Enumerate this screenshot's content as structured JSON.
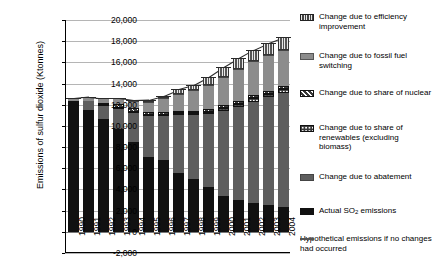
{
  "axes": {
    "ylabel": "Emissions of sulfur dioxide (Ktonnes)",
    "yticks": [
      "20,000",
      "18,000",
      "16,000",
      "14,000",
      "12,000",
      "10,000",
      "8,000",
      "6,000",
      "4,000",
      "2,000",
      "0",
      "-2,000"
    ]
  },
  "legend": {
    "items": [
      {
        "key": "effic",
        "swatch": "vertical-stripe-swatch",
        "label": "Change due to efficiency improvement"
      },
      {
        "key": "fossil",
        "swatch": "solid-gray-swatch",
        "label": "Change due to fossil fuel switching"
      },
      {
        "key": "nuclear",
        "swatch": "diagonal-hatch-swatch",
        "label": "Change due to share of nuclear"
      },
      {
        "key": "renew",
        "swatch": "dotted-swatch",
        "label": "Change due to share of renewables (excluding biomass)"
      },
      {
        "key": "abate",
        "swatch": "dark-gray-swatch",
        "label": "Change due to abatement"
      },
      {
        "key": "actual",
        "swatch": "black-swatch",
        "label": "Actual SO2 emissions"
      },
      {
        "key": "hypo",
        "swatch": "line-swatch",
        "label": "Hypothetical emissions if no changes had occurred"
      }
    ]
  },
  "chart_data": {
    "type": "bar",
    "title": "",
    "xlabel": "",
    "ylabel": "Emissions of sulfur dioxide (Ktonnes)",
    "ylim": [
      -2000,
      20000
    ],
    "ytick_step": 2000,
    "grid": true,
    "stacked": true,
    "legend_position": "right",
    "categories": [
      "1990",
      "1991",
      "1992",
      "1993",
      "1994",
      "1995",
      "1996",
      "1997",
      "1998",
      "1999",
      "2000",
      "2001",
      "2002",
      "2003",
      "2004"
    ],
    "series": [
      {
        "name": "Actual SO2 emissions",
        "key": "actual",
        "values": [
          12400,
          11500,
          10700,
          9700,
          8500,
          7100,
          6800,
          5600,
          5000,
          4200,
          3400,
          3000,
          2700,
          2500,
          2300
        ]
      },
      {
        "name": "Change due to abatement",
        "key": "abate",
        "values": [
          0,
          900,
          1200,
          1900,
          2700,
          3800,
          4100,
          5400,
          6000,
          6900,
          8000,
          8800,
          9600,
          10200,
          10800
        ]
      },
      {
        "name": "Change due to share of renewables (excluding biomass)",
        "key": "renew",
        "values": [
          0,
          0,
          100,
          100,
          100,
          150,
          150,
          200,
          200,
          250,
          300,
          300,
          350,
          350,
          400
        ]
      },
      {
        "name": "Change due to share of nuclear",
        "key": "nuclear",
        "values": [
          0,
          0,
          200,
          400,
          400,
          250,
          250,
          250,
          250,
          250,
          250,
          250,
          250,
          250,
          250
        ]
      },
      {
        "name": "Change due to fossil fuel switching",
        "key": "fossil",
        "values": [
          200,
          350,
          400,
          500,
          700,
          1000,
          1300,
          1600,
          1900,
          2300,
          2700,
          3000,
          3200,
          3400,
          3450
        ]
      },
      {
        "name": "Change due to efficiency improvement",
        "key": "effic",
        "values": [
          0,
          0,
          0,
          0,
          0,
          150,
          250,
          400,
          500,
          700,
          900,
          1050,
          1100,
          1150,
          1200
        ]
      }
    ],
    "hypothetical_emissions": [
      12600,
      12750,
      12600,
      12600,
      12400,
      12450,
      12850,
      13450,
      13850,
      14600,
      15550,
      16400,
      17200,
      17850,
      18400
    ],
    "hypothetical_series_name": "Hypothetical emissions if no changes had occurred"
  }
}
